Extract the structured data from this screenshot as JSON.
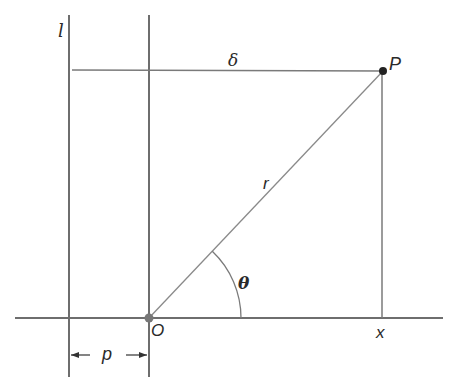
{
  "diagram": {
    "colors": {
      "line": "#6e6e6e",
      "thin_line": "#8a8a8a",
      "point": "#222222",
      "origin_point": "#777777",
      "text": "#2a2a2a",
      "background": "#ffffff"
    },
    "labels": {
      "directrix": "l",
      "delta": "δ",
      "point_p": "P",
      "radius": "r",
      "angle": "θ",
      "origin": "O",
      "x": "x",
      "p": "p"
    },
    "elements": {
      "directrix_line": "vertical line l",
      "focus_vertical_line": "vertical line through O",
      "horizontal_axis": "horizontal axis through O",
      "delta_segment": "distance from P to l",
      "radius_segment": "segment OP",
      "perpendicular_segment": "perpendicular from P to axis",
      "angle_arc": "angle θ arc",
      "p_dimension": "distance p between l and O"
    }
  }
}
